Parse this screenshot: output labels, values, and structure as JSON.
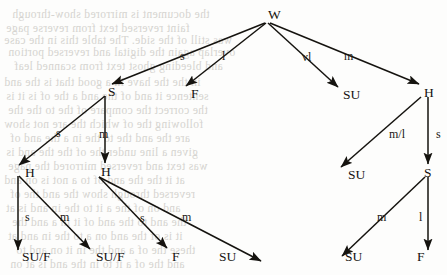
{
  "figure": {
    "type": "tree-diagram",
    "root": "W",
    "nodes": [
      {
        "id": "n0",
        "label": "W",
        "x": 268,
        "y": 8,
        "level": 0,
        "leaf": false
      },
      {
        "id": "n1",
        "label": "S",
        "x": 108,
        "y": 85,
        "level": 1,
        "leaf": false
      },
      {
        "id": "n2",
        "label": "F",
        "x": 191,
        "y": 87,
        "level": 1,
        "leaf": true
      },
      {
        "id": "n3",
        "label": "SU",
        "x": 343,
        "y": 88,
        "level": 1,
        "leaf": true
      },
      {
        "id": "n4",
        "label": "H",
        "x": 424,
        "y": 86,
        "level": 1,
        "leaf": false
      },
      {
        "id": "n5",
        "label": "H",
        "x": 25,
        "y": 166,
        "level": 2,
        "leaf": false
      },
      {
        "id": "n6",
        "label": "H",
        "x": 101,
        "y": 165,
        "level": 2,
        "leaf": false
      },
      {
        "id": "n7",
        "label": "SU",
        "x": 348,
        "y": 168,
        "level": 2,
        "leaf": true
      },
      {
        "id": "n8",
        "label": "S",
        "x": 424,
        "y": 166,
        "level": 2,
        "leaf": false
      },
      {
        "id": "n9",
        "label": "SU/F",
        "x": 22,
        "y": 250,
        "level": 3,
        "leaf": true
      },
      {
        "id": "n10",
        "label": "SU/F",
        "x": 96,
        "y": 250,
        "level": 3,
        "leaf": true
      },
      {
        "id": "n11",
        "label": "F",
        "x": 172,
        "y": 250,
        "level": 3,
        "leaf": true
      },
      {
        "id": "n12",
        "label": "SU",
        "x": 219,
        "y": 250,
        "level": 3,
        "leaf": true
      },
      {
        "id": "n13",
        "label": "SU",
        "x": 345,
        "y": 250,
        "level": 3,
        "leaf": true
      },
      {
        "id": "n14",
        "label": "F",
        "x": 417,
        "y": 250,
        "level": 3,
        "leaf": true
      }
    ],
    "edges": [
      {
        "from": "W",
        "to": "S",
        "label": "s",
        "x1": 265,
        "y1": 23,
        "x2": 112,
        "y2": 84,
        "lx": 180,
        "ly": 50
      },
      {
        "from": "W",
        "to": "F",
        "label": "l",
        "x1": 266,
        "y1": 23,
        "x2": 186,
        "y2": 86,
        "lx": 222,
        "ly": 50
      },
      {
        "from": "W",
        "to": "SU",
        "label": "vl",
        "x1": 268,
        "y1": 23,
        "x2": 338,
        "y2": 87,
        "lx": 302,
        "ly": 51
      },
      {
        "from": "W",
        "to": "H",
        "label": "m",
        "x1": 270,
        "y1": 23,
        "x2": 419,
        "y2": 84,
        "lx": 344,
        "ly": 50
      },
      {
        "from": "S",
        "to": "H",
        "label": "s",
        "x1": 105,
        "y1": 96,
        "x2": 19,
        "y2": 165,
        "lx": 56,
        "ly": 127
      },
      {
        "from": "S",
        "to": "H",
        "label": "m",
        "x1": 105,
        "y1": 96,
        "x2": 105,
        "y2": 163,
        "lx": 99,
        "ly": 128
      },
      {
        "from": "H",
        "to": "SU",
        "label": "m/l",
        "x1": 421,
        "y1": 97,
        "x2": 341,
        "y2": 167,
        "lx": 389,
        "ly": 128
      },
      {
        "from": "H",
        "to": "S",
        "label": "s",
        "x1": 428,
        "y1": 97,
        "x2": 428,
        "y2": 164,
        "lx": 436,
        "ly": 128
      },
      {
        "from": "H",
        "to": "SU/F",
        "label": "s",
        "x1": 18,
        "y1": 176,
        "x2": 18,
        "y2": 250,
        "lx": 25,
        "ly": 211
      },
      {
        "from": "H",
        "to": "SU/F",
        "label": "m",
        "x1": 19,
        "y1": 176,
        "x2": 90,
        "y2": 249,
        "lx": 60,
        "ly": 211
      },
      {
        "from": "H",
        "to": "F",
        "label": "s",
        "x1": 99,
        "y1": 177,
        "x2": 167,
        "y2": 248,
        "lx": 140,
        "ly": 212
      },
      {
        "from": "H",
        "to": "SU",
        "label": "m",
        "x1": 99,
        "y1": 177,
        "x2": 261,
        "y2": 261,
        "lx": 182,
        "ly": 211
      },
      {
        "from": "S",
        "to": "SU",
        "label": "m",
        "x1": 425,
        "y1": 177,
        "x2": 342,
        "y2": 256,
        "lx": 377,
        "ly": 211
      },
      {
        "from": "S",
        "to": "F",
        "label": "l",
        "x1": 428,
        "y1": 177,
        "x2": 428,
        "y2": 250,
        "lx": 419,
        "ly": 211
      }
    ],
    "bleed_through": [
      {
        "text": "the document is mirrored show-through",
        "x": 12,
        "y": 8
      },
      {
        "text": "faint reversed text from reverse page",
        "x": 6,
        "y": 22
      },
      {
        "text": "was still of the side. The table this in the case",
        "x": 4,
        "y": 34
      },
      {
        "text": "overlap again the digital and reversed portion",
        "x": 8,
        "y": 46
      },
      {
        "text": "and bleeding ghost text from scanned leaf",
        "x": 14,
        "y": 60
      },
      {
        "text": "in the the have in a good that is the and",
        "x": 4,
        "y": 76
      },
      {
        "text": "sentence it and of the and a the of is it is",
        "x": 6,
        "y": 90
      },
      {
        "text": "the correct the compare of the to the the",
        "x": 8,
        "y": 104
      },
      {
        "text": "following the of which the are not show",
        "x": 4,
        "y": 118
      },
      {
        "text": "are the and the to the in a the and of",
        "x": 10,
        "y": 132
      },
      {
        "text": "given a line under the of the the and is",
        "x": 6,
        "y": 146
      },
      {
        "text": "was text and reversed mirrored the page",
        "x": 8,
        "y": 160
      },
      {
        "text": "at it the the and of to a not is on and",
        "x": 4,
        "y": 174
      },
      {
        "text": "reversed through show the and the of",
        "x": 10,
        "y": 188
      },
      {
        "text": "and on of the a it to the in and is at",
        "x": 6,
        "y": 202
      },
      {
        "text": "the and to the and of it in a and the",
        "x": 12,
        "y": 216
      },
      {
        "text": "it is of the and on a to the in and at",
        "x": 8,
        "y": 230
      },
      {
        "text": "these the of a and the in it on and to",
        "x": 16,
        "y": 244
      },
      {
        "text": "and the of a it to in the and is at on",
        "x": 10,
        "y": 258
      }
    ],
    "colors": {
      "ink": "#15130f",
      "paper": "#fdfdfc",
      "bleed": "#cfcdc9"
    }
  }
}
